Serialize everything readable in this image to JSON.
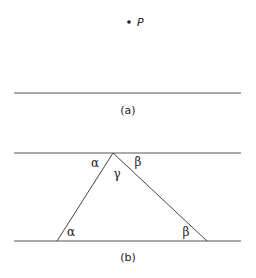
{
  "figure_a": {
    "point_label": "P",
    "caption": "(a)"
  },
  "figure_b": {
    "angles": {
      "top_left": "α",
      "top_middle": "γ",
      "top_right": "β",
      "bottom_left": "α",
      "bottom_right": "β"
    },
    "caption": "(b)"
  },
  "colors": {
    "line": "#555555",
    "text": "#222222"
  }
}
